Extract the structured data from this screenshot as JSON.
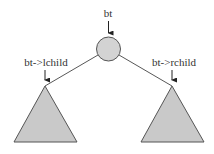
{
  "diagram": {
    "type": "binary-tree-recursion",
    "root": {
      "label": "bt",
      "shape": "circle",
      "cx": 108.5,
      "cy": 49,
      "r": 12,
      "fill": "#d3d3d3",
      "stroke": "#555555"
    },
    "left_subtree": {
      "label": "bt->lchild",
      "shape": "triangle",
      "apex": [
        45,
        86
      ],
      "base_left": [
        14,
        142
      ],
      "base_right": [
        77,
        142
      ],
      "fill": "#c9c9c9",
      "stroke": "#555555"
    },
    "right_subtree": {
      "label": "bt->rchild",
      "shape": "triangle",
      "apex": [
        172,
        86
      ],
      "base_left": [
        141,
        142
      ],
      "base_right": [
        204,
        142
      ],
      "fill": "#c9c9c9",
      "stroke": "#555555"
    },
    "edge_color": "#444444"
  }
}
